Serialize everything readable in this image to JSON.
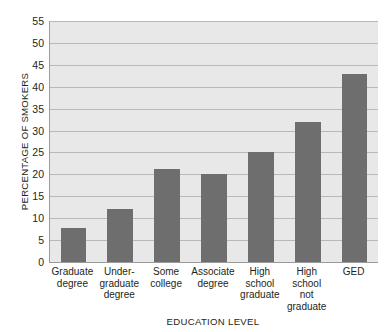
{
  "chart_data": {
    "type": "bar",
    "title": "",
    "xlabel": "EDUCATION LEVEL",
    "ylabel": "PERCENTAGE OF SMOKERS",
    "categories": [
      "Graduate degree",
      "Under-graduate degree",
      "Some college",
      "Associate degree",
      "High school graduate",
      "High school not graduate",
      "GED"
    ],
    "category_lines": [
      [
        "Graduate",
        "degree"
      ],
      [
        "Under-",
        "graduate",
        "degree"
      ],
      [
        "Some",
        "college"
      ],
      [
        "Associate",
        "degree"
      ],
      [
        "High",
        "school",
        "graduate"
      ],
      [
        "High",
        "school",
        "not",
        "graduate"
      ],
      [
        "GED"
      ]
    ],
    "values": [
      7.8,
      12.0,
      21.3,
      20.0,
      25.0,
      32.0,
      43.0
    ],
    "ylim": [
      0,
      55
    ],
    "ytick_step": 5,
    "yticks": [
      0,
      5,
      10,
      15,
      20,
      25,
      30,
      35,
      40,
      45,
      50,
      55
    ],
    "ytick_labels": [
      "0",
      "5",
      "10",
      "15",
      "20",
      "25",
      "30",
      "35",
      "40",
      "45",
      "50",
      "55"
    ],
    "grid": true,
    "legend": false,
    "legend_position": "none",
    "bar_color": "#6e6e6e",
    "plot_background": "#e8e8e8",
    "gridline_color": "#b9b9b9",
    "axis_color": "#9a9a9a",
    "text_color": "#231f20"
  }
}
